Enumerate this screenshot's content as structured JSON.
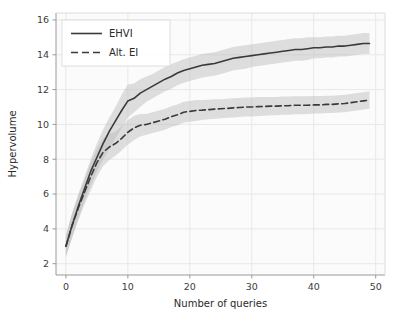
{
  "chart_data": {
    "type": "line",
    "title": "",
    "xlabel": "Number of queries",
    "ylabel": "Hypervolume",
    "xlim": [
      -1.6,
      51.5
    ],
    "ylim": [
      1.35,
      16.4
    ],
    "xticks": [
      0,
      10,
      20,
      30,
      40,
      50
    ],
    "yticks": [
      2,
      4,
      6,
      8,
      10,
      12,
      14,
      16
    ],
    "grid": true,
    "legend_position": "upper left",
    "band_type": "confidence-interval",
    "x": [
      0,
      1,
      2,
      3,
      4,
      5,
      6,
      7,
      8,
      9,
      10,
      11,
      12,
      13,
      14,
      15,
      16,
      17,
      18,
      19,
      20,
      21,
      22,
      23,
      24,
      25,
      26,
      27,
      28,
      29,
      30,
      31,
      32,
      33,
      34,
      35,
      36,
      37,
      38,
      39,
      40,
      41,
      42,
      43,
      44,
      45,
      46,
      47,
      48,
      49
    ],
    "series": [
      {
        "name": "EHVI",
        "style": "solid",
        "color": "#3a3a3a",
        "values": [
          3.0,
          4.2,
          5.3,
          6.3,
          7.3,
          8.1,
          8.9,
          9.6,
          10.2,
          10.8,
          11.35,
          11.5,
          11.8,
          12.0,
          12.2,
          12.4,
          12.6,
          12.75,
          12.95,
          13.1,
          13.2,
          13.3,
          13.4,
          13.45,
          13.5,
          13.6,
          13.7,
          13.8,
          13.85,
          13.9,
          13.95,
          14.0,
          14.05,
          14.1,
          14.15,
          14.2,
          14.25,
          14.3,
          14.3,
          14.35,
          14.4,
          14.4,
          14.45,
          14.45,
          14.5,
          14.5,
          14.55,
          14.6,
          14.65,
          14.65
        ],
        "band_lower": [
          2.4,
          3.5,
          4.6,
          5.6,
          6.5,
          7.3,
          8.0,
          8.6,
          9.2,
          9.8,
          10.4,
          10.7,
          11.0,
          11.3,
          11.5,
          11.7,
          11.9,
          12.05,
          12.25,
          12.4,
          12.5,
          12.6,
          12.7,
          12.75,
          12.8,
          12.9,
          13.0,
          13.1,
          13.15,
          13.2,
          13.3,
          13.35,
          13.4,
          13.45,
          13.5,
          13.55,
          13.6,
          13.65,
          13.65,
          13.7,
          13.8,
          13.8,
          13.85,
          13.85,
          13.9,
          13.9,
          13.95,
          14.0,
          14.05,
          14.05
        ],
        "band_upper": [
          3.6,
          4.9,
          6.0,
          7.0,
          8.0,
          8.9,
          9.7,
          10.4,
          11.0,
          11.7,
          12.3,
          12.35,
          12.6,
          12.75,
          12.9,
          13.1,
          13.3,
          13.45,
          13.6,
          13.75,
          13.85,
          13.95,
          14.05,
          14.1,
          14.15,
          14.25,
          14.35,
          14.45,
          14.5,
          14.55,
          14.6,
          14.65,
          14.7,
          14.75,
          14.8,
          14.85,
          14.9,
          14.95,
          14.95,
          15.0,
          15.0,
          15.0,
          15.05,
          15.05,
          15.1,
          15.1,
          15.15,
          15.2,
          15.25,
          15.25
        ]
      },
      {
        "name": "Alt. EI",
        "style": "dashed",
        "color": "#3a3a3a",
        "values": [
          3.0,
          4.2,
          5.2,
          6.1,
          7.0,
          7.8,
          8.4,
          8.7,
          8.9,
          9.2,
          9.55,
          9.8,
          9.95,
          10.0,
          10.1,
          10.2,
          10.3,
          10.45,
          10.55,
          10.7,
          10.75,
          10.8,
          10.82,
          10.85,
          10.88,
          10.9,
          10.92,
          10.95,
          10.97,
          11.0,
          11.0,
          11.02,
          11.03,
          11.05,
          11.05,
          11.07,
          11.08,
          11.1,
          11.1,
          11.1,
          11.12,
          11.12,
          11.15,
          11.15,
          11.18,
          11.2,
          11.25,
          11.3,
          11.35,
          11.4
        ],
        "band_lower": [
          2.4,
          3.5,
          4.5,
          5.4,
          6.2,
          7.0,
          7.6,
          7.95,
          8.2,
          8.5,
          8.85,
          9.1,
          9.3,
          9.4,
          9.5,
          9.6,
          9.7,
          9.85,
          9.95,
          10.1,
          10.15,
          10.2,
          10.25,
          10.3,
          10.33,
          10.35,
          10.38,
          10.4,
          10.42,
          10.45,
          10.45,
          10.48,
          10.5,
          10.52,
          10.53,
          10.55,
          10.56,
          10.58,
          10.58,
          10.6,
          10.62,
          10.62,
          10.65,
          10.65,
          10.68,
          10.7,
          10.75,
          10.8,
          10.85,
          10.9
        ],
        "band_upper": [
          3.6,
          4.9,
          5.9,
          6.8,
          7.8,
          8.6,
          9.2,
          9.45,
          9.6,
          9.9,
          10.25,
          10.5,
          10.6,
          10.6,
          10.7,
          10.8,
          10.9,
          11.05,
          11.15,
          11.3,
          11.35,
          11.4,
          11.4,
          11.42,
          11.44,
          11.45,
          11.47,
          11.5,
          11.52,
          11.55,
          11.55,
          11.57,
          11.57,
          11.58,
          11.58,
          11.6,
          11.6,
          11.62,
          11.62,
          11.62,
          11.63,
          11.63,
          11.65,
          11.65,
          11.68,
          11.7,
          11.75,
          11.8,
          11.85,
          11.9
        ]
      }
    ]
  },
  "legend": {
    "items": [
      {
        "label": "EHVI",
        "style": "solid"
      },
      {
        "label": "Alt. EI",
        "style": "dashed"
      }
    ]
  },
  "colors": {
    "line": "#3a3a3a",
    "band": "#b9b9b9",
    "grid": "#e8e8e8",
    "axis": "#9a9a9a",
    "plot_background": "#fbfbfb",
    "figure_background": "#ffffff",
    "text": "#2a2a2a"
  }
}
